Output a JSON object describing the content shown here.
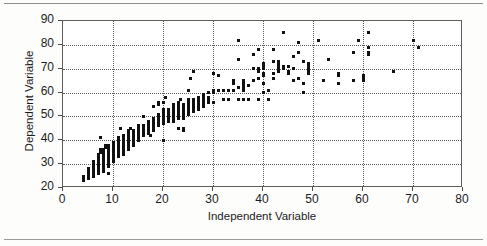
{
  "chart_data": {
    "type": "scatter",
    "title": "",
    "xlabel": "Independent Variable",
    "ylabel": "Dependent Variable",
    "xlim": [
      0,
      80
    ],
    "ylim": [
      20,
      90
    ],
    "xticks": [
      0,
      10,
      20,
      30,
      40,
      50,
      60,
      70,
      80
    ],
    "yticks": [
      20,
      30,
      40,
      50,
      60,
      70,
      80,
      90
    ],
    "grid": true,
    "legend": null,
    "marker_color": "#111111",
    "series": [
      {
        "name": "observations",
        "points": [
          [
            4,
            23
          ],
          [
            4,
            24
          ],
          [
            4,
            25
          ],
          [
            5,
            24
          ],
          [
            5,
            25
          ],
          [
            5,
            26
          ],
          [
            5,
            27
          ],
          [
            5,
            28
          ],
          [
            6,
            25
          ],
          [
            6,
            26
          ],
          [
            6,
            27
          ],
          [
            6,
            28
          ],
          [
            6,
            29
          ],
          [
            6,
            30
          ],
          [
            6,
            31
          ],
          [
            7,
            26
          ],
          [
            7,
            27
          ],
          [
            7,
            28
          ],
          [
            7,
            29
          ],
          [
            7,
            30
          ],
          [
            7,
            31
          ],
          [
            7,
            32
          ],
          [
            7,
            33
          ],
          [
            7,
            34
          ],
          [
            7.5,
            35
          ],
          [
            7.5,
            36
          ],
          [
            7.5,
            41
          ],
          [
            8,
            27
          ],
          [
            8,
            28
          ],
          [
            8,
            29
          ],
          [
            8,
            30
          ],
          [
            8,
            31
          ],
          [
            8,
            32
          ],
          [
            8,
            33
          ],
          [
            8,
            34
          ],
          [
            8,
            35
          ],
          [
            8,
            36
          ],
          [
            8.5,
            37
          ],
          [
            8.5,
            38
          ],
          [
            9,
            26
          ],
          [
            9,
            29
          ],
          [
            9,
            30
          ],
          [
            9,
            31
          ],
          [
            9,
            32
          ],
          [
            9,
            33
          ],
          [
            9,
            34
          ],
          [
            9,
            35
          ],
          [
            9,
            36
          ],
          [
            9,
            37
          ],
          [
            9,
            38
          ],
          [
            10,
            31
          ],
          [
            10,
            32
          ],
          [
            10,
            33
          ],
          [
            10,
            34
          ],
          [
            10,
            35
          ],
          [
            10,
            36
          ],
          [
            10,
            37
          ],
          [
            10,
            38
          ],
          [
            10,
            39
          ],
          [
            11,
            33
          ],
          [
            11,
            34
          ],
          [
            11,
            35
          ],
          [
            11,
            36
          ],
          [
            11,
            37
          ],
          [
            11,
            38
          ],
          [
            11,
            39
          ],
          [
            11,
            40
          ],
          [
            11,
            41
          ],
          [
            11.5,
            45
          ],
          [
            12,
            34
          ],
          [
            12,
            35
          ],
          [
            12,
            36
          ],
          [
            12,
            37
          ],
          [
            12,
            38
          ],
          [
            12,
            39
          ],
          [
            12,
            40
          ],
          [
            12,
            41
          ],
          [
            12,
            42
          ],
          [
            13,
            36
          ],
          [
            13,
            37
          ],
          [
            13,
            38
          ],
          [
            13,
            39
          ],
          [
            13,
            40
          ],
          [
            13,
            41
          ],
          [
            13,
            42
          ],
          [
            13,
            43
          ],
          [
            13,
            44
          ],
          [
            13.5,
            45
          ],
          [
            14,
            38
          ],
          [
            14,
            39
          ],
          [
            14,
            40
          ],
          [
            14,
            41
          ],
          [
            14,
            42
          ],
          [
            14,
            43
          ],
          [
            14,
            44
          ],
          [
            15,
            40
          ],
          [
            15,
            41
          ],
          [
            15,
            42
          ],
          [
            15,
            43
          ],
          [
            15,
            44
          ],
          [
            15,
            45
          ],
          [
            15,
            46
          ],
          [
            16,
            42
          ],
          [
            16,
            43
          ],
          [
            16,
            44
          ],
          [
            16,
            45
          ],
          [
            16,
            46
          ],
          [
            16,
            50
          ],
          [
            17,
            43
          ],
          [
            17,
            44
          ],
          [
            17,
            45
          ],
          [
            17,
            46
          ],
          [
            17,
            47
          ],
          [
            17,
            48
          ],
          [
            17.5,
            42
          ],
          [
            18,
            44
          ],
          [
            18,
            45
          ],
          [
            18,
            46
          ],
          [
            18,
            47
          ],
          [
            18,
            48
          ],
          [
            18,
            49
          ],
          [
            18,
            54
          ],
          [
            19,
            46
          ],
          [
            19,
            47
          ],
          [
            19,
            48
          ],
          [
            19,
            49
          ],
          [
            19,
            50
          ],
          [
            19,
            51
          ],
          [
            19,
            55
          ],
          [
            19,
            56
          ],
          [
            20,
            40
          ],
          [
            20,
            47
          ],
          [
            20,
            48
          ],
          [
            20,
            49
          ],
          [
            20,
            50
          ],
          [
            20,
            51
          ],
          [
            20,
            52
          ],
          [
            20,
            53
          ],
          [
            20,
            56
          ],
          [
            20.5,
            58
          ],
          [
            21,
            48
          ],
          [
            21,
            49
          ],
          [
            21,
            50
          ],
          [
            21,
            51
          ],
          [
            21,
            52
          ],
          [
            21,
            53
          ],
          [
            22,
            48
          ],
          [
            22,
            49
          ],
          [
            22,
            50
          ],
          [
            22,
            51
          ],
          [
            22,
            52
          ],
          [
            22,
            53
          ],
          [
            22,
            54
          ],
          [
            22,
            55
          ],
          [
            23,
            45
          ],
          [
            23,
            49
          ],
          [
            23,
            50
          ],
          [
            23,
            51
          ],
          [
            23,
            52
          ],
          [
            23,
            53
          ],
          [
            23,
            54
          ],
          [
            23,
            55
          ],
          [
            23,
            56
          ],
          [
            23.5,
            57
          ],
          [
            24,
            44
          ],
          [
            24,
            45
          ],
          [
            24,
            49
          ],
          [
            24,
            50
          ],
          [
            24,
            51
          ],
          [
            24,
            52
          ],
          [
            24,
            53
          ],
          [
            24,
            54
          ],
          [
            24,
            55
          ],
          [
            25,
            51
          ],
          [
            25,
            52
          ],
          [
            25,
            53
          ],
          [
            25,
            54
          ],
          [
            25,
            55
          ],
          [
            25,
            56
          ],
          [
            25,
            57
          ],
          [
            25,
            61
          ],
          [
            25.5,
            66
          ],
          [
            26,
            52
          ],
          [
            26,
            53
          ],
          [
            26,
            54
          ],
          [
            26,
            55
          ],
          [
            26,
            56
          ],
          [
            26,
            57
          ],
          [
            26,
            69
          ],
          [
            27,
            53
          ],
          [
            27,
            54
          ],
          [
            27,
            55
          ],
          [
            27,
            56
          ],
          [
            27,
            57
          ],
          [
            27,
            58
          ],
          [
            28,
            54
          ],
          [
            28,
            55
          ],
          [
            28,
            56
          ],
          [
            28,
            57
          ],
          [
            28,
            58
          ],
          [
            28,
            59
          ],
          [
            29,
            56
          ],
          [
            29,
            57
          ],
          [
            29,
            58
          ],
          [
            29,
            60
          ],
          [
            30,
            56
          ],
          [
            30,
            60
          ],
          [
            30,
            61
          ],
          [
            30,
            68
          ],
          [
            31,
            61
          ],
          [
            31,
            67
          ],
          [
            32,
            61
          ],
          [
            32,
            57
          ],
          [
            33,
            57
          ],
          [
            33,
            61
          ],
          [
            34,
            61
          ],
          [
            34,
            64
          ],
          [
            34,
            65
          ],
          [
            35,
            57
          ],
          [
            35,
            62
          ],
          [
            35,
            74
          ],
          [
            35,
            82
          ],
          [
            36,
            57
          ],
          [
            36,
            61
          ],
          [
            36,
            62
          ],
          [
            36,
            63
          ],
          [
            36,
            64
          ],
          [
            36,
            65
          ],
          [
            37,
            57
          ],
          [
            37,
            63
          ],
          [
            38,
            65
          ],
          [
            38,
            70
          ],
          [
            38,
            76
          ],
          [
            39,
            57
          ],
          [
            39,
            66
          ],
          [
            39,
            69
          ],
          [
            39,
            70
          ],
          [
            39,
            78
          ],
          [
            40,
            60
          ],
          [
            40,
            64
          ],
          [
            40,
            67
          ],
          [
            40,
            68
          ],
          [
            40,
            70
          ],
          [
            40,
            71
          ],
          [
            40,
            72
          ],
          [
            41,
            57
          ],
          [
            41,
            61
          ],
          [
            42,
            66
          ],
          [
            42,
            68
          ],
          [
            42,
            73
          ],
          [
            42,
            78
          ],
          [
            43,
            69
          ],
          [
            43,
            70
          ],
          [
            43,
            71
          ],
          [
            43,
            72
          ],
          [
            43,
            73
          ],
          [
            44,
            70
          ],
          [
            44,
            71
          ],
          [
            44,
            85
          ],
          [
            45,
            68
          ],
          [
            45,
            69
          ],
          [
            45,
            71
          ],
          [
            46,
            65
          ],
          [
            46,
            70
          ],
          [
            46,
            75
          ],
          [
            47,
            66
          ],
          [
            47,
            77
          ],
          [
            47,
            81
          ],
          [
            48,
            60
          ],
          [
            48,
            64
          ],
          [
            48,
            73
          ],
          [
            49,
            68
          ],
          [
            49,
            69
          ],
          [
            49,
            70
          ],
          [
            49,
            71
          ],
          [
            49,
            72
          ],
          [
            51,
            82
          ],
          [
            52,
            65
          ],
          [
            53,
            74
          ],
          [
            55,
            64
          ],
          [
            55,
            67
          ],
          [
            55,
            68
          ],
          [
            58,
            65
          ],
          [
            58,
            77
          ],
          [
            59,
            82
          ],
          [
            60,
            65
          ],
          [
            60,
            66
          ],
          [
            60,
            67
          ],
          [
            61,
            76
          ],
          [
            61,
            77
          ],
          [
            61,
            79
          ],
          [
            61,
            85
          ],
          [
            66,
            69
          ],
          [
            70,
            82
          ],
          [
            71,
            79
          ]
        ]
      }
    ]
  }
}
